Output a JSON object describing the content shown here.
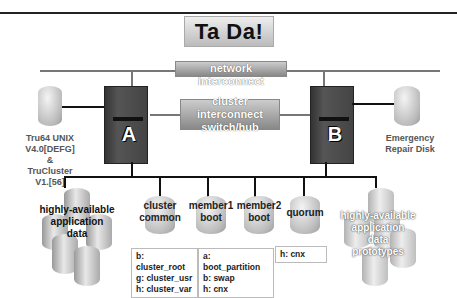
{
  "title": "Ta Da!",
  "network": {
    "label": "network interconnect"
  },
  "cluster_switch": {
    "line1": "cluster interconnect",
    "line2": "switch/hub"
  },
  "servers": [
    {
      "letter": "A"
    },
    {
      "letter": "B"
    }
  ],
  "left_disk": {
    "lines": [
      "Tru64 UNIX",
      "V4.0[DEFG]",
      "&",
      "TruCluster",
      "V1.[56]"
    ]
  },
  "right_disk": {
    "lines": [
      "Emergency",
      "Repair Disk"
    ]
  },
  "storage": {
    "ha_data": {
      "lines": [
        "highly-available",
        "application",
        "data"
      ]
    },
    "cluster_common": {
      "lines": [
        "cluster",
        "common"
      ],
      "partitions": [
        "b: cluster_root",
        "g: cluster_usr",
        "h: cluster_var"
      ]
    },
    "member1_boot": {
      "lines": [
        "member1",
        "boot"
      ]
    },
    "member2_boot": {
      "lines": [
        "member2",
        "boot"
      ]
    },
    "member_partitions": [
      "a: boot_partition",
      "b: swap",
      "h: cnx"
    ],
    "quorum": {
      "lines": [
        "quorum"
      ],
      "partitions": [
        "h: cnx"
      ]
    },
    "ha_prototypes": {
      "lines": [
        "highly-available",
        "application",
        "data",
        "prototypes"
      ]
    }
  }
}
